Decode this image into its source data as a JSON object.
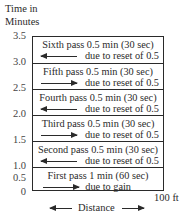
{
  "y_axis": {
    "label_line1": "Time in",
    "label_line2": "Minutes",
    "ticks": [
      "3.5",
      "3.0",
      "2.5",
      "2.0",
      "1.5",
      "1.0",
      "0.5",
      "0"
    ]
  },
  "passes": [
    {
      "title": "Sixth pass 0.5 min (30 sec)",
      "note": "due to reset of 0.5",
      "direction": "left"
    },
    {
      "title": "Fifth pass 0.5 min (30 sec)",
      "note": "due to reset of 0.5",
      "direction": "right"
    },
    {
      "title": "Fourth pass 0.5 min (30 sec)",
      "note": "due to reset of 0.5",
      "direction": "left"
    },
    {
      "title": "Third pass 0.5 min (30 sec)",
      "note": "due to reset of 0.5",
      "direction": "right"
    },
    {
      "title": "Second pass 0.5 min (30 sec)",
      "note": "due to reset of 0.5",
      "direction": "left"
    },
    {
      "title": "First pass 1 min (60 sec)",
      "note": "due to gain",
      "direction": "right"
    }
  ],
  "x_axis": {
    "label": "Distance",
    "end_label": "100 ft"
  }
}
